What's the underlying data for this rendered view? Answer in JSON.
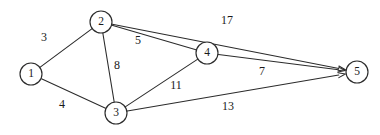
{
  "figure": {
    "type": "directed-weighted-graph",
    "background_color": "#ffffff",
    "stroke_color": "#2b2b2b",
    "text_color": "#1a1a1a",
    "width": 380,
    "height": 135
  },
  "chart_data": {
    "type": "diagram",
    "title": "",
    "nodes": [
      {
        "id": "1",
        "label": "1",
        "x": 31,
        "y": 74,
        "r": 11
      },
      {
        "id": "2",
        "label": "2",
        "x": 101,
        "y": 22,
        "r": 11
      },
      {
        "id": "3",
        "label": "3",
        "x": 116,
        "y": 113,
        "r": 11
      },
      {
        "id": "4",
        "label": "4",
        "x": 207,
        "y": 53,
        "r": 11
      },
      {
        "id": "5",
        "label": "5",
        "x": 357,
        "y": 72,
        "r": 11
      }
    ],
    "edges": [
      {
        "id": "e-1-2",
        "from": "1",
        "to": "2",
        "weight": "3",
        "directed": false,
        "label_x": 44,
        "label_y": 38
      },
      {
        "id": "e-1-3",
        "from": "1",
        "to": "3",
        "weight": "4",
        "directed": false,
        "label_x": 62,
        "label_y": 105
      },
      {
        "id": "e-2-3",
        "from": "2",
        "to": "3",
        "weight": "8",
        "directed": false,
        "label_x": 117,
        "label_y": 66
      },
      {
        "id": "e-2-4",
        "from": "2",
        "to": "4",
        "weight": "5",
        "directed": false,
        "label_x": 138,
        "label_y": 41
      },
      {
        "id": "e-3-4",
        "from": "3",
        "to": "4",
        "weight": "11",
        "directed": false,
        "label_x": 176,
        "label_y": 86
      },
      {
        "id": "e-2-5",
        "from": "2",
        "to": "5",
        "weight": "17",
        "directed": true,
        "label_x": 227,
        "label_y": 21
      },
      {
        "id": "e-4-5",
        "from": "4",
        "to": "5",
        "weight": "7",
        "directed": true,
        "label_x": 262,
        "label_y": 72
      },
      {
        "id": "e-3-5",
        "from": "3",
        "to": "5",
        "weight": "13",
        "directed": true,
        "label_x": 228,
        "label_y": 107
      }
    ]
  }
}
